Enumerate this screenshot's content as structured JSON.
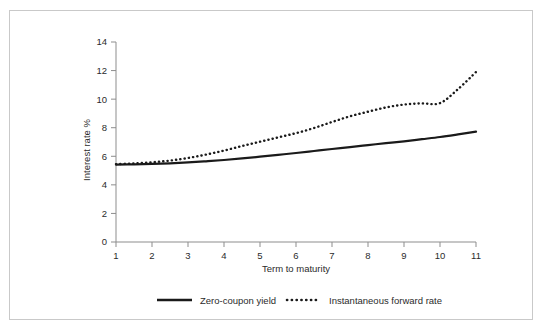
{
  "figure": {
    "frame_color": "#c9c9c9",
    "background": "#ffffff",
    "ink_color": "#1a1a1a"
  },
  "chart_data": {
    "type": "line",
    "title": "",
    "subtitle": "",
    "xlabel": "Term to maturity",
    "ylabel": "Interest rate %",
    "xlim": [
      1,
      11
    ],
    "ylim": [
      0,
      14
    ],
    "xticks": [
      1,
      2,
      3,
      4,
      5,
      6,
      7,
      8,
      9,
      10,
      11
    ],
    "xtick_labels": [
      "1",
      "2",
      "3",
      "4",
      "5",
      "6",
      "7",
      "8",
      "9",
      "10",
      "11"
    ],
    "yticks": [
      0,
      2,
      4,
      6,
      8,
      10,
      12,
      14
    ],
    "ytick_labels": [
      "0",
      "2",
      "4",
      "6",
      "8",
      "10",
      "12",
      "14"
    ],
    "grid": false,
    "legend_position": "below",
    "x": [
      1,
      1.5,
      2,
      2.5,
      3,
      3.5,
      4,
      4.5,
      5,
      5.5,
      6,
      6.5,
      7,
      7.5,
      8,
      8.5,
      9,
      9.5,
      10,
      10.5,
      11
    ],
    "series": [
      {
        "name": "Zero-coupon yield",
        "style": "solid",
        "color": "#1a1a1a",
        "values": [
          5.42,
          5.44,
          5.47,
          5.51,
          5.57,
          5.65,
          5.74,
          5.85,
          5.97,
          6.1,
          6.23,
          6.37,
          6.51,
          6.64,
          6.78,
          6.92,
          7.05,
          7.2,
          7.35,
          7.53,
          7.72
        ]
      },
      {
        "name": "Instantaneous forward rate",
        "style": "dotted",
        "color": "#1a1a1a",
        "values": [
          5.45,
          5.5,
          5.58,
          5.7,
          5.88,
          6.12,
          6.4,
          6.72,
          7.02,
          7.32,
          7.62,
          7.98,
          8.4,
          8.8,
          9.12,
          9.42,
          9.62,
          9.7,
          9.72,
          10.7,
          11.9
        ]
      }
    ]
  },
  "legend": {
    "items": [
      {
        "label": "Zero-coupon yield",
        "style": "solid"
      },
      {
        "label": "Instantaneous forward rate",
        "style": "dotted"
      }
    ]
  }
}
